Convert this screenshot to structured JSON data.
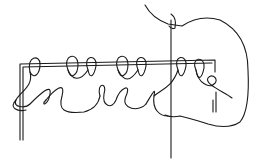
{
  "diagram": {
    "width": 258,
    "height": 164,
    "background": "#ffffff",
    "stroke_color": "#1a1a1a",
    "parts": {
      "rod_frame": [
        "M20 140 L20 64 L215 60 L215 72",
        "M23 140 L23 67 L212 63",
        "M213 100 L213 112 M216 92 L216 112"
      ],
      "needle": [
        "M171 20 L171 158",
        "M171 14 Q177 18 175 28 Q172 30 169 26"
      ],
      "bag_outline": [
        "M145 5 Q152 18 168 24 L182 26 Q200 14 220 20 Q248 34 248 70 Q250 110 240 122 Q228 130 208 124 Q196 120 180 116 Q172 118 165 115"
      ],
      "top_loops": [
        "M30 72 C26 56 40 54 40 64 C40 74 34 80 30 72",
        "M68 70 C62 54 78 52 78 64 C78 76 70 80 68 70",
        "M88 70 C82 54 98 54 96 66 C94 76 90 80 88 70",
        "M118 70 C112 54 128 52 128 64 C128 76 120 80 118 70",
        "M138 70 C132 54 148 54 146 66 C144 76 140 80 138 70",
        "M178 70 C172 54 188 54 186 66 C184 76 180 80 178 70",
        "M196 70 C190 56 206 56 204 68 C202 78 198 82 196 70"
      ],
      "lower_chain": [
        "M30 72 C34 86 20 92 16 100 C12 108 26 108 30 104 C38 96 52 82 50 94 C48 106 40 106 46 100",
        "M46 100 C54 90 66 80 62 96 C58 110 64 114 84 112 C92 110 98 106 100 96",
        "M68 70 C72 80 80 82 88 70",
        "M100 96 C96 82 108 82 104 94 C102 106 112 110 116 100 C120 88 132 82 126 96 C120 110 140 112 146 104",
        "M118 70 C124 82 130 82 138 70",
        "M146 104 C152 94 156 86 154 96 C152 110 160 116 168 116",
        "M154 96 C160 90 172 88 178 70",
        "M196 70 C198 84 210 88 214 84 C220 80 212 72 208 78 C204 84 224 92 232 98"
      ],
      "left_hook": [
        "M16 100 C8 108 18 112 26 110"
      ]
    }
  }
}
